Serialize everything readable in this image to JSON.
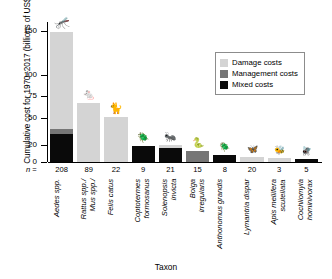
{
  "chart_data": {
    "type": "bar",
    "title": "",
    "xlabel": "Taxon",
    "ylabel": "Cumulative cost for 1970–2017 (billions of US$)",
    "ylim": [
      0,
      160
    ],
    "yticks": [
      0,
      20,
      50,
      75,
      100,
      150
    ],
    "ytick_labels": [
      "0",
      "20",
      "50",
      "75",
      "100",
      "150"
    ],
    "grid": false,
    "legend_position": "upper right",
    "stacked": true,
    "categories": [
      "Aedes spp.",
      "Rattus spp./\nMus spp./",
      "Felis catus",
      "Coptotermes\nformosanus",
      "Solenopsis\ninvicta",
      "Boiga\nirregularis",
      "Anthonomus grandis",
      "Lymantria dispar",
      "Apis mellifera\nscutellata",
      "Cochliomyia\nhominivorax"
    ],
    "n_prefix": "n =",
    "n_values": [
      208,
      89,
      22,
      9,
      21,
      15,
      8,
      20,
      3,
      5
    ],
    "series": [
      {
        "name": "Mixed costs",
        "color": "#0a0a0a",
        "values": [
          32,
          0,
          0,
          18,
          16,
          0,
          8,
          0,
          0,
          4
        ]
      },
      {
        "name": "Management costs",
        "color": "#767676",
        "values": [
          6,
          0,
          0,
          0,
          0,
          13,
          0,
          0,
          0,
          0
        ]
      },
      {
        "name": "Damage costs",
        "color": "#d4d4d4",
        "values": [
          111,
          67,
          51,
          0,
          3,
          0,
          0,
          6,
          5,
          0
        ]
      }
    ],
    "totals": [
      149,
      67,
      51,
      18,
      19,
      13,
      8,
      6,
      5,
      4
    ],
    "silhouettes": [
      "mosquito-silhouette",
      "rat-silhouette",
      "cat-silhouette",
      "termite-silhouette",
      "fire-ant-silhouette",
      "snake-silhouette",
      "boll-weevil-silhouette",
      "moth-silhouette",
      "bee-silhouette",
      "screwworm-fly-silhouette"
    ]
  },
  "legend": {
    "items": [
      {
        "label": "Damage costs",
        "color": "#d4d4d4"
      },
      {
        "label": "Management costs",
        "color": "#767676"
      },
      {
        "label": "Mixed costs",
        "color": "#0a0a0a"
      }
    ]
  }
}
